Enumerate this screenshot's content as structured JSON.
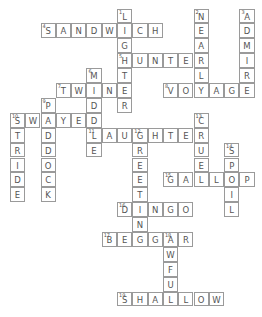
{
  "puzzle": {
    "type": "crossword",
    "words": [
      {
        "number": 1,
        "answer": "LIGHTER",
        "direction": "down",
        "row": 0,
        "col": 5
      },
      {
        "number": 2,
        "answer": "NEARLY",
        "direction": "down",
        "row": 0,
        "col": 10
      },
      {
        "number": 3,
        "answer": "ADMIRE",
        "direction": "down",
        "row": 0,
        "col": 13
      },
      {
        "number": 4,
        "answer": "SANDWICH",
        "direction": "across",
        "row": 1,
        "col": 0
      },
      {
        "number": 5,
        "answer": "HUNTER",
        "direction": "across",
        "row": 3,
        "col": 5
      },
      {
        "number": 6,
        "answer": "MIDDLE",
        "direction": "down",
        "row": 4,
        "col": 3
      },
      {
        "number": 7,
        "answer": "TWINE",
        "direction": "across",
        "row": 5,
        "col": 1
      },
      {
        "number": 8,
        "answer": "VOYAGE",
        "direction": "across",
        "row": 5,
        "col": 8
      },
      {
        "number": 9,
        "answer": "PADDOCK",
        "direction": "down",
        "row": 6,
        "col": 0
      },
      {
        "number": 10,
        "answer": "SWAYED",
        "direction": "across",
        "row": 7,
        "col": -2
      },
      {
        "number": 10,
        "answer": "STRIDE",
        "direction": "down",
        "row": 7,
        "col": -2
      },
      {
        "number": 11,
        "answer": "LAUGHTER",
        "direction": "across",
        "row": 8,
        "col": 3
      },
      {
        "number": 12,
        "answer": "GREETING",
        "direction": "down",
        "row": 8,
        "col": 6
      },
      {
        "number": 13,
        "answer": "CRUEL",
        "direction": "down",
        "row": 7,
        "col": 10
      },
      {
        "number": 14,
        "answer": "SPOIL",
        "direction": "down",
        "row": 9,
        "col": 12
      },
      {
        "number": 15,
        "answer": "GALLOP",
        "direction": "across",
        "row": 11,
        "col": 8
      },
      {
        "number": 16,
        "answer": "DINGO",
        "direction": "across",
        "row": 13,
        "col": 5
      },
      {
        "number": 17,
        "answer": "BEGGAR",
        "direction": "across",
        "row": 15,
        "col": 4
      },
      {
        "number": 18,
        "answer": "AWFUL",
        "direction": "down",
        "row": 15,
        "col": 8
      },
      {
        "number": 19,
        "answer": "SHALLOW",
        "direction": "across",
        "row": 19,
        "col": 5
      }
    ]
  },
  "colors": {
    "border": "#9a9a9a",
    "text": "#555555",
    "background": "#ffffff"
  }
}
